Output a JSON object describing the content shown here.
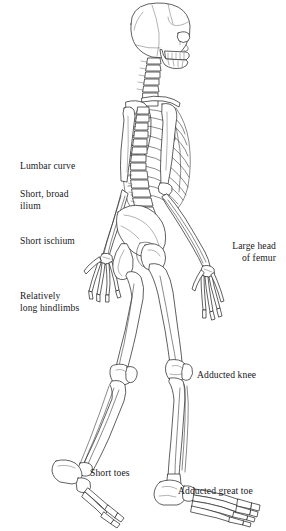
{
  "figure": {
    "view": "lateral-left",
    "style": "line-drawing",
    "background_color": "#ffffff",
    "line_color": "#2b2b2b",
    "text_color": "#18181a"
  },
  "labels": [
    {
      "id": "lumbar-curve",
      "text": "Lumbar curve",
      "align": "left",
      "x": 20,
      "y": 160,
      "feature": "lumbar-vertebrae"
    },
    {
      "id": "short-broad-ilium",
      "text": "Short, broad\nilium",
      "align": "left",
      "x": 20,
      "y": 188,
      "feature": "ilium"
    },
    {
      "id": "short-ischium",
      "text": "Short ischium",
      "align": "left",
      "x": 20,
      "y": 235,
      "feature": "ischium"
    },
    {
      "id": "relatively-long-hindlimbs",
      "text": "Relatively\nlong hindlimbs",
      "align": "left",
      "x": 20,
      "y": 290,
      "feature": "femur-tibia"
    },
    {
      "id": "large-head-of-femur",
      "text": "Large head\nof femur",
      "align": "right",
      "x": 216,
      "y": 240,
      "feature": "femoral-head"
    },
    {
      "id": "adducted-knee",
      "text": "Adducted knee",
      "align": "left",
      "x": 197,
      "y": 369,
      "feature": "knee-joint"
    },
    {
      "id": "short-toes",
      "text": "Short toes",
      "align": "left",
      "x": 90,
      "y": 467,
      "feature": "phalanges-rear-foot"
    },
    {
      "id": "adducted-great-toe",
      "text": "Adducted great toe",
      "align": "left",
      "x": 178,
      "y": 485,
      "feature": "hallux"
    }
  ],
  "anatomy_parts": [
    "cranium",
    "mandible",
    "cervical-vertebrae",
    "clavicle",
    "scapula",
    "ribcage",
    "sternum",
    "thoracic-vertebrae",
    "lumbar-vertebrae",
    "humerus",
    "radius",
    "ulna",
    "carpals",
    "metacarpals",
    "phalanges-hand",
    "pelvis",
    "ilium",
    "ischium",
    "sacrum",
    "femur",
    "patella",
    "tibia",
    "fibula",
    "tarsals",
    "metatarsals",
    "phalanges-foot"
  ]
}
